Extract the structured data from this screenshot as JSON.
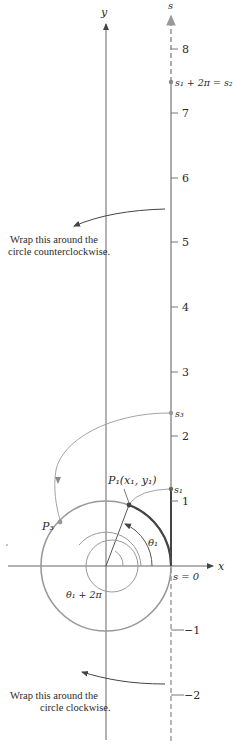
{
  "figure": {
    "axes": {
      "x_label": "x",
      "y_label": "y",
      "s_label": "s"
    },
    "s_ticks": [
      {
        "value": 8,
        "label": "8",
        "y": 49
      },
      {
        "value": 7,
        "label": "7",
        "y": 113
      },
      {
        "value": 6,
        "label": "6",
        "y": 178
      },
      {
        "value": 5,
        "label": "5",
        "y": 242
      },
      {
        "value": 4,
        "label": "4",
        "y": 307
      },
      {
        "value": 3,
        "label": "3",
        "y": 372
      },
      {
        "value": 2,
        "label": "2",
        "y": 436
      },
      {
        "value": 1,
        "label": "1",
        "y": 501
      },
      {
        "value": -1,
        "label": "−1",
        "y": 630
      },
      {
        "value": -2,
        "label": "−2",
        "y": 695
      }
    ],
    "s_origin_label": "s = 0",
    "points": {
      "s1": "s₁",
      "s2_eq": "s₁ + 2π = s₂",
      "s3": "s₃",
      "P1": "P₁(x₁, y₁)",
      "P3": "P₃"
    },
    "angles": {
      "theta1": "θ₁",
      "theta1_plus_2pi": "θ₁ + 2π"
    },
    "notes": {
      "ccw_line1": "Wrap this around the",
      "ccw_line2": "circle counterclockwise.",
      "cw_line1": "Wrap this around the",
      "cw_line2": "circle clockwise."
    },
    "colors": {
      "axis": "#555555",
      "circle": "#999999",
      "thick": "#444444",
      "dot": "#888888"
    }
  }
}
